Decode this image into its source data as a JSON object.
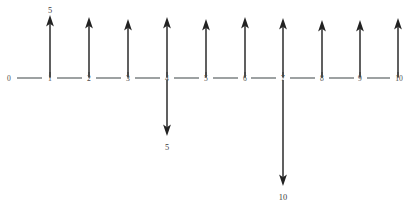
{
  "diagram": {
    "axis": {
      "name": "number-line",
      "min": 0,
      "max": 10,
      "tick_labels": [
        "0",
        "1",
        "2",
        "3",
        "4",
        "5",
        "6",
        "7",
        "8",
        "9",
        "10"
      ],
      "tick_positions": [
        0,
        1,
        2,
        3,
        4,
        5,
        6,
        7,
        8,
        9,
        10
      ],
      "line_color": "#555b5e"
    },
    "vectors_up": [
      {
        "at": 1,
        "label": "5"
      },
      {
        "at": 2,
        "label": ""
      },
      {
        "at": 3,
        "label": ""
      },
      {
        "at": 4,
        "label": ""
      },
      {
        "at": 5,
        "label": ""
      },
      {
        "at": 6,
        "label": ""
      },
      {
        "at": 7,
        "label": ""
      },
      {
        "at": 8,
        "label": ""
      },
      {
        "at": 9,
        "label": ""
      },
      {
        "at": 10,
        "label": ""
      }
    ],
    "vectors_down": [
      {
        "at": 4,
        "label": "5",
        "length": "short"
      },
      {
        "at": 7,
        "label": "10",
        "length": "long"
      }
    ],
    "arrow_color": "#2b2b2b"
  }
}
